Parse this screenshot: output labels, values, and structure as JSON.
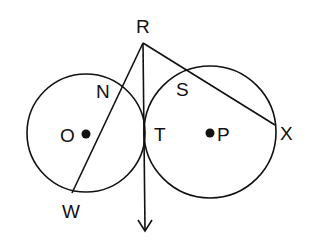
{
  "diagram": {
    "labels": {
      "R": "R",
      "N": "N",
      "S": "S",
      "O": "O",
      "T": "T",
      "P": "P",
      "X": "X",
      "W": "W"
    },
    "circles": [
      {
        "name": "circle-O",
        "center": "O",
        "cx": 86,
        "cy": 133,
        "r": 59
      },
      {
        "name": "circle-P",
        "center": "P",
        "cx": 210,
        "cy": 132,
        "r": 66
      }
    ],
    "segments": [
      {
        "name": "secant-RW",
        "from": "R",
        "to": "W",
        "via": "N"
      },
      {
        "name": "secant-RX",
        "from": "R",
        "to": "X",
        "via": "S"
      }
    ],
    "ray": {
      "name": "tangent-ray-RT",
      "from": "R",
      "through": "T"
    },
    "stroke_color": "#111111",
    "background": "#ffffff"
  }
}
